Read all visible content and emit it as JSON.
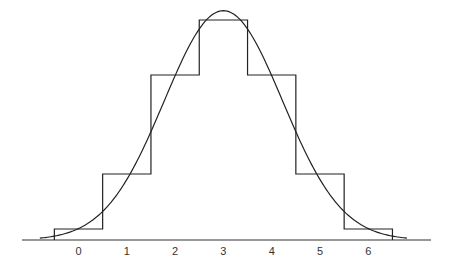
{
  "chart_data": {
    "type": "bar",
    "title": "",
    "xlabel": "",
    "ylabel": "",
    "categories": [
      "0",
      "1",
      "2",
      "3",
      "4",
      "5",
      "6"
    ],
    "series": [
      {
        "name": "binomial-histogram",
        "type": "step-bar",
        "values": [
          1,
          6,
          15,
          20,
          15,
          6,
          1
        ]
      },
      {
        "name": "normal-curve",
        "type": "line",
        "mean": 3,
        "sd": 1.2247,
        "x_range": [
          -0.8,
          6.8
        ]
      }
    ],
    "ylim": [
      0,
      21
    ],
    "grid": false,
    "legend": "none",
    "colors": {
      "line": "#222222",
      "axis": "#333333",
      "background": "#ffffff"
    }
  },
  "axis": {
    "tick_labels": [
      "0",
      "1",
      "2",
      "3",
      "4",
      "5",
      "6"
    ]
  }
}
